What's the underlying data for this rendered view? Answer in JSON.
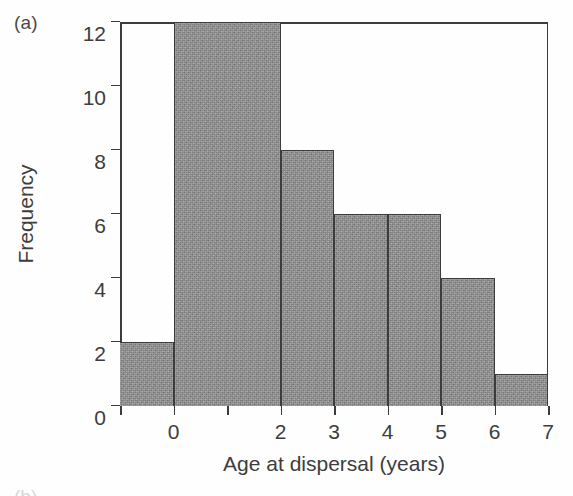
{
  "figure": {
    "panel_label": "(a)",
    "next_panel_label_partial": "(b)"
  },
  "chart_data": {
    "type": "bar",
    "title": "",
    "subtitle": "",
    "xlabel": "Age at dispersal (years)",
    "ylabel": "Frequency",
    "xlim": [
      -1,
      7
    ],
    "ylim": [
      0,
      12
    ],
    "grid": false,
    "legend": null,
    "bin_width": 1,
    "bin_edges": [
      -1,
      0,
      1,
      2,
      3,
      4,
      5,
      6,
      7
    ],
    "categories": [
      "-1 to 0",
      "0 to 1",
      "1 to 2",
      "2 to 3",
      "3 to 4",
      "4 to 5",
      "5 to 6",
      "6 to 7"
    ],
    "values": [
      2,
      12,
      12,
      8,
      6,
      6,
      4,
      1
    ],
    "bars": [
      {
        "left": -1,
        "right": 0,
        "value": 2
      },
      {
        "left": 0,
        "right": 2,
        "value": 12
      },
      {
        "left": 2,
        "right": 3,
        "value": 8
      },
      {
        "left": 3,
        "right": 4,
        "value": 6
      },
      {
        "left": 4,
        "right": 5,
        "value": 6
      },
      {
        "left": 5,
        "right": 6,
        "value": 4
      },
      {
        "left": 6,
        "right": 7,
        "value": 1
      }
    ],
    "y_ticks": [
      {
        "value": 0,
        "label": "0"
      },
      {
        "value": 2,
        "label": "2"
      },
      {
        "value": 4,
        "label": "4"
      },
      {
        "value": 6,
        "label": "6"
      },
      {
        "value": 8,
        "label": "8"
      },
      {
        "value": 10,
        "label": "10"
      },
      {
        "value": 12,
        "label": "12"
      }
    ],
    "x_ticks": [
      {
        "value": -1,
        "label": ""
      },
      {
        "value": 0,
        "label": "0"
      },
      {
        "value": 1,
        "label": ""
      },
      {
        "value": 2,
        "label": "2"
      },
      {
        "value": 3,
        "label": "3"
      },
      {
        "value": 4,
        "label": "4"
      },
      {
        "value": 5,
        "label": "5"
      },
      {
        "value": 6,
        "label": "6"
      },
      {
        "value": 7,
        "label": "7"
      }
    ],
    "colors": {
      "bar_fill": "#8d8d8d",
      "bar_stroke": "#3c3c3c",
      "axis": "#3c3c3c",
      "text": "#3d3d3d",
      "background": "#fefefe"
    }
  }
}
